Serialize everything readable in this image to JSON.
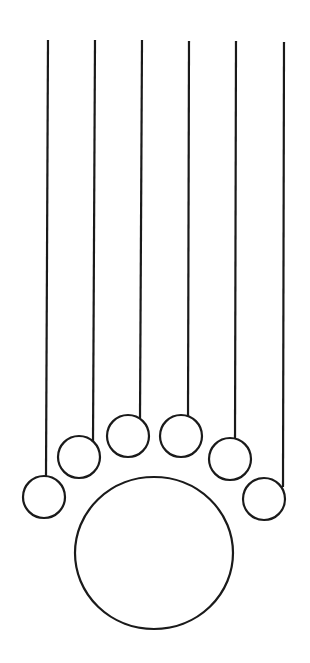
{
  "diagram": {
    "title": "",
    "stroke_color": "#1a1a1a",
    "background_color": "#ffffff",
    "string_count": 6,
    "small_circle_count": 6,
    "large_circle_count": 1
  }
}
